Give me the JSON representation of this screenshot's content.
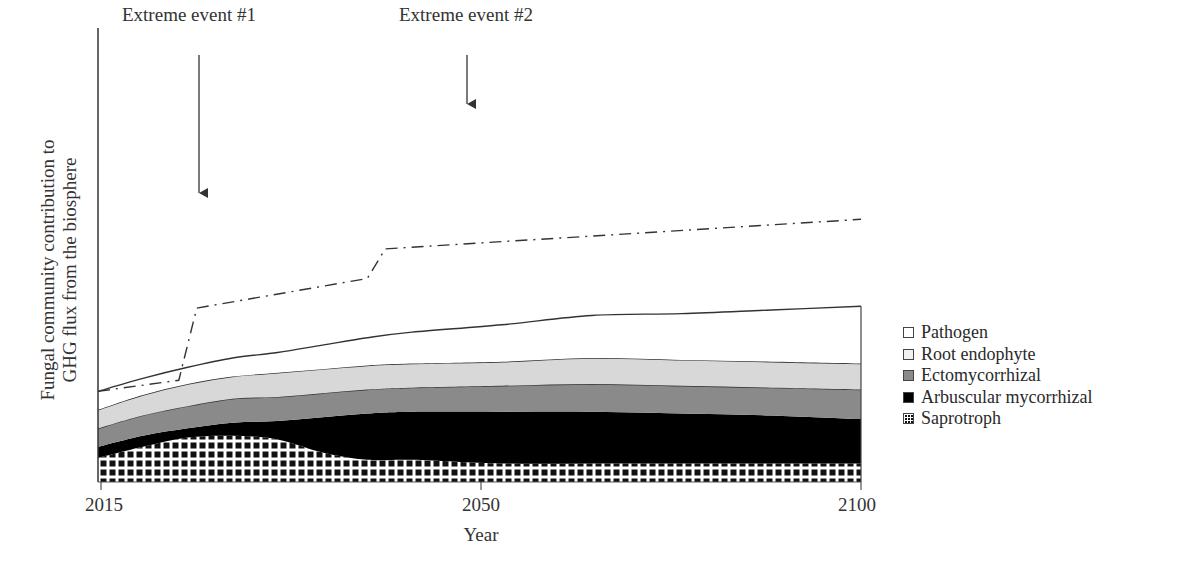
{
  "chart_data": {
    "type": "area",
    "stacked": true,
    "title": "",
    "xlabel": "Year",
    "ylabel": "Fungal community contribution to GHG flux from the biosphere",
    "ylabel_lines": [
      "Fungal community contribution to",
      "GHG flux from the biosphere"
    ],
    "x_ticks": [
      "2015",
      "2050",
      "2100"
    ],
    "xlim": [
      2015,
      2100
    ],
    "y_ticks": [],
    "grid": false,
    "legend_position": "right",
    "x": [
      2015,
      2020,
      2025,
      2030,
      2035,
      2040,
      2045,
      2050,
      2060,
      2070,
      2080,
      2090,
      2100
    ],
    "series": [
      {
        "name": "Saprotroph",
        "pattern": "grid",
        "values": [
          13,
          19,
          24,
          25,
          23,
          16,
          12,
          12,
          10,
          10,
          10,
          10,
          10
        ]
      },
      {
        "name": "Arbuscular mycorrhizal",
        "color": "#000000",
        "values": [
          6,
          6,
          5,
          7,
          10,
          19,
          25,
          26,
          28,
          28,
          27,
          26,
          24
        ]
      },
      {
        "name": "Ectomycorrhizal",
        "color": "#8a8a8a",
        "values": [
          10,
          11,
          12,
          13,
          13,
          13,
          13,
          13,
          14,
          15,
          15,
          15,
          16
        ]
      },
      {
        "name": "Root endophyte",
        "color": "#d8d8d8",
        "values": [
          10,
          11,
          12,
          12,
          13,
          13,
          13,
          13,
          13,
          14,
          14,
          14,
          14
        ]
      },
      {
        "name": "Pathogen",
        "color": "#ffffff",
        "values": [
          10,
          9,
          9,
          10,
          11,
          13,
          15,
          17,
          20,
          23,
          25,
          28,
          31
        ]
      }
    ],
    "dash_dot_line": {
      "name": "Total with extreme events",
      "points": [
        [
          2015,
          49
        ],
        [
          2024,
          55
        ],
        [
          2026,
          94
        ],
        [
          2045,
          110
        ],
        [
          2047,
          126
        ],
        [
          2100,
          142
        ]
      ]
    },
    "annotations": [
      {
        "text": "Extreme event #1",
        "x": 2026,
        "arrow": true
      },
      {
        "text": "Extreme event #2",
        "x": 2047,
        "arrow": true
      }
    ]
  },
  "legend": {
    "items": [
      {
        "label": "Pathogen",
        "color": "#ffffff",
        "pattern": "none"
      },
      {
        "label": "Root endophyte",
        "color": "#f2f2f2",
        "pattern": "none"
      },
      {
        "label": "Ectomycorrhizal",
        "color": "#8a8a8a",
        "pattern": "none"
      },
      {
        "label": "Arbuscular mycorrhizal",
        "color": "#000000",
        "pattern": "none"
      },
      {
        "label": "Saprotroph",
        "color": "#ffffff",
        "pattern": "grid"
      }
    ]
  }
}
